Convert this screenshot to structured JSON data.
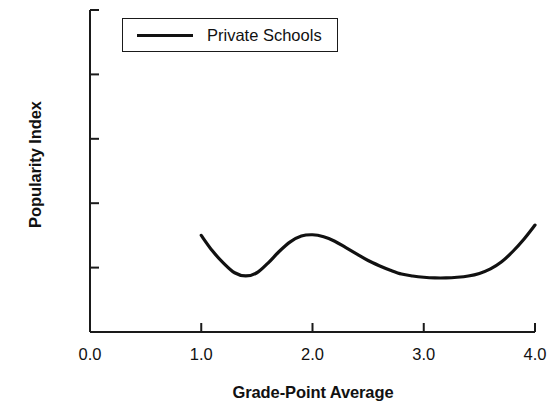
{
  "chart_data": {
    "type": "line",
    "title": "",
    "subtitle": "",
    "xlabel": "Grade-Point Average",
    "ylabel": "Popularity Index",
    "xlim": [
      0.0,
      4.0
    ],
    "ylim": [
      -0.1,
      0.4
    ],
    "xticks": [
      0.0,
      1.0,
      2.0,
      3.0,
      4.0
    ],
    "xtick_labels": [
      "0.0",
      "1.0",
      "2.0",
      "3.0",
      "4.0"
    ],
    "yticks": [
      -0.1,
      0.0,
      0.1,
      0.2,
      0.3,
      0.4
    ],
    "ytick_labels": [
      "-0.1",
      "0.0",
      "0.1",
      "0.2",
      "0.3",
      "0.4"
    ],
    "grid": false,
    "legend_position": "upper-left",
    "series": [
      {
        "name": "Private Schools",
        "color": "#111111",
        "line_width": 3.2,
        "x": [
          1.0,
          1.1,
          1.2,
          1.3,
          1.4,
          1.5,
          1.6,
          1.7,
          1.8,
          1.9,
          2.0,
          2.1,
          2.2,
          2.3,
          2.4,
          2.5,
          2.6,
          2.7,
          2.8,
          2.9,
          3.0,
          3.1,
          3.2,
          3.3,
          3.4,
          3.5,
          3.6,
          3.7,
          3.8,
          3.9,
          4.0
        ],
        "y": [
          0.05,
          0.026,
          0.007,
          -0.008,
          -0.013,
          -0.008,
          0.007,
          0.025,
          0.04,
          0.049,
          0.051,
          0.048,
          0.041,
          0.031,
          0.021,
          0.011,
          0.003,
          -0.004,
          -0.01,
          -0.013,
          -0.015,
          -0.016,
          -0.016,
          -0.015,
          -0.013,
          -0.009,
          -0.002,
          0.009,
          0.025,
          0.044,
          0.066
        ]
      }
    ]
  },
  "axes": {
    "y_title": "Popularity Index",
    "x_title": "Grade-Point Average"
  },
  "legend": {
    "entries": [
      {
        "label": "Private Schools",
        "color": "#111111"
      }
    ]
  },
  "colors": {
    "background": "#ffffff",
    "ink": "#111111",
    "axis": "#1a1a1a"
  }
}
